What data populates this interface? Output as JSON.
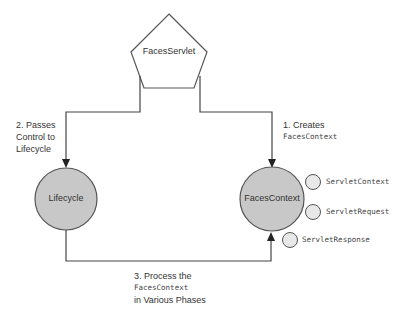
{
  "nodes": {
    "servlet": {
      "label": "FacesServlet",
      "shape": "pentagon"
    },
    "lifecycle": {
      "label": "Lifecycle",
      "shape": "circle",
      "fill": "#c8c8c8"
    },
    "context": {
      "label": "FacesContext",
      "shape": "circle",
      "fill": "#c8c8c8"
    },
    "servlet_context": {
      "label": "ServletContext",
      "shape": "small-circle",
      "fill": "#e8e8e8"
    },
    "servlet_request": {
      "label": "ServletRequest",
      "shape": "small-circle",
      "fill": "#e8e8e8"
    },
    "servlet_response": {
      "label": "ServletResponse",
      "shape": "small-circle",
      "fill": "#e8e8e8"
    }
  },
  "edges": {
    "step1": {
      "line1": "1. Creates",
      "line2": "FacesContext"
    },
    "step2": {
      "line1": "2. Passes",
      "line2": "Control to",
      "line3": "Lifecycle"
    },
    "step3": {
      "line1": "3. Process the",
      "line2": "FacesContext",
      "line3": "in Various Phases"
    }
  },
  "colors": {
    "line": "#333333",
    "node_fill": "#c8c8c8",
    "small_fill": "#e8e8e8"
  }
}
